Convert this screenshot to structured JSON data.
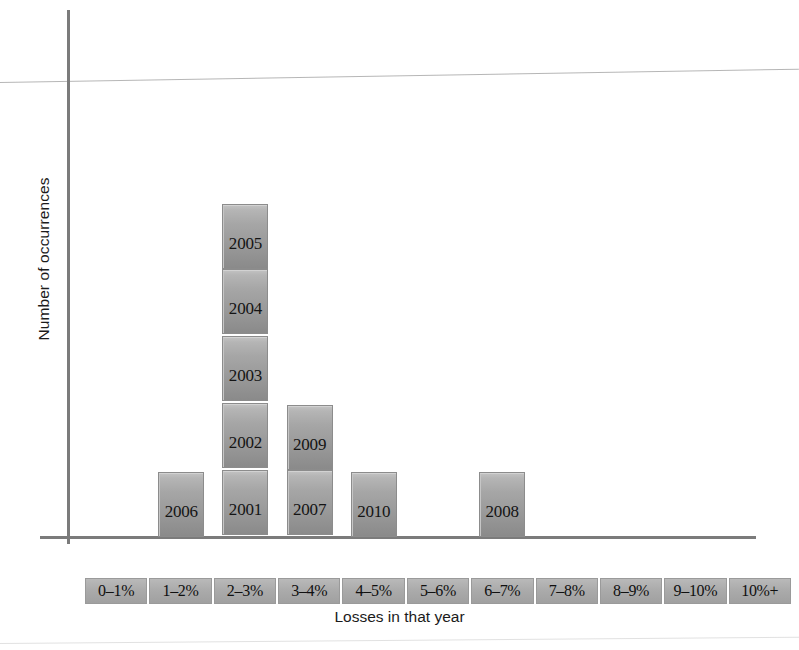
{
  "chart_data": {
    "type": "bar",
    "title": "",
    "xlabel": "Losses in that year",
    "ylabel": "Number of occurrences",
    "grid": false,
    "legend": false,
    "axis_ranges": {
      "ylim": [
        0,
        8
      ]
    },
    "note": "Stacked histogram: each bin stacks one labelled block per year falling in that loss range.",
    "categories": [
      "0–1%",
      "1–2%",
      "2–3%",
      "3–4%",
      "4–5%",
      "5–6%",
      "6–7%",
      "7–8%",
      "8–9%",
      "9–10%",
      "10%+"
    ],
    "values": [
      0,
      1,
      5,
      2,
      1,
      0,
      1,
      0,
      0,
      0,
      0
    ],
    "stacks": [
      {
        "category": "0–1%",
        "count": 0,
        "years": []
      },
      {
        "category": "1–2%",
        "count": 1,
        "years": [
          "2006"
        ]
      },
      {
        "category": "2–3%",
        "count": 5,
        "years": [
          "2001",
          "2002",
          "2003",
          "2004",
          "2005"
        ]
      },
      {
        "category": "3–4%",
        "count": 2,
        "years": [
          "2007",
          "2009"
        ]
      },
      {
        "category": "4–5%",
        "count": 1,
        "years": [
          "2010"
        ]
      },
      {
        "category": "5–6%",
        "count": 0,
        "years": []
      },
      {
        "category": "6–7%",
        "count": 1,
        "years": [
          "2008"
        ]
      },
      {
        "category": "7–8%",
        "count": 0,
        "years": []
      },
      {
        "category": "8–9%",
        "count": 0,
        "years": []
      },
      {
        "category": "9–10%",
        "count": 0,
        "years": []
      },
      {
        "category": "10%+",
        "count": 0,
        "years": []
      }
    ],
    "colors": {
      "bar_fill": "#a3a3a3",
      "bar_border": "#8c8c8c",
      "tick_box_fill": "#ababab",
      "axis": "#7b7b7b",
      "text": "#141414",
      "background": "#ffffff"
    }
  }
}
